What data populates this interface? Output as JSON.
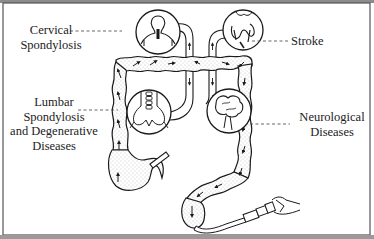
{
  "diagram": {
    "type": "anatomical illustration",
    "colors": {
      "line": "#1a1a1a",
      "stipple": "#9a9a9a",
      "leader": "#555555",
      "border": "#555555",
      "top_band": "#8c8c8c",
      "background": "#ffffff"
    },
    "labels": {
      "cervical": {
        "line1": "Cervical",
        "line2": "Spondylosis"
      },
      "stroke": {
        "line1": "Stroke"
      },
      "lumbar": {
        "line1": "Lumbar",
        "line2": "Spondylosis",
        "line3": "and Degenerative",
        "line4": "Diseases"
      },
      "neurological": {
        "line1": "Neurological",
        "line2": "Diseases"
      }
    },
    "insets": [
      {
        "name": "cervical-spine",
        "depicts": "head, neck and shoulders with cervical spine"
      },
      {
        "name": "brain-stroke",
        "depicts": "brain cross-section"
      },
      {
        "name": "lumbar-spine",
        "depicts": "lumbar vertebrae and pelvis"
      },
      {
        "name": "brain-neurological",
        "depicts": "brain"
      }
    ]
  }
}
